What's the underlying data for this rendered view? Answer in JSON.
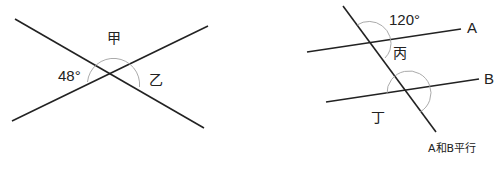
{
  "left_figure": {
    "labels": {
      "top_angle": "甲",
      "left_angle": "48°",
      "right_angle": "乙"
    },
    "lines": [
      {
        "name": "line-1",
        "x1": 15,
        "y1": 19,
        "x2": 204,
        "y2": 128
      },
      {
        "name": "line-2",
        "x1": 12,
        "y1": 121,
        "x2": 208,
        "y2": 26
      }
    ],
    "intersection": {
      "x": 110,
      "y": 73
    }
  },
  "right_figure": {
    "labels": {
      "line_a": "A",
      "line_b": "B",
      "upper_angle": "120°",
      "upper_inner_angle": "丙",
      "lower_angle": "丁",
      "note": "A和B平行"
    },
    "lines": [
      {
        "name": "transversal",
        "x1": 343,
        "y1": 6,
        "x2": 436,
        "y2": 132
      },
      {
        "name": "line-a",
        "x1": 307,
        "y1": 52,
        "x2": 461,
        "y2": 29
      },
      {
        "name": "line-b",
        "x1": 326,
        "y1": 102,
        "x2": 479,
        "y2": 79
      }
    ]
  },
  "colors": {
    "line": "#222222",
    "arc": "#a0a0a0",
    "text": "#222222",
    "background": "#ffffff"
  }
}
